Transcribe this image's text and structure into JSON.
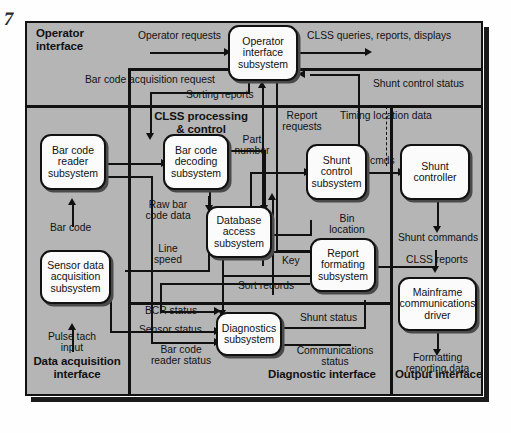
{
  "figure": {
    "folio_mark": "7",
    "background_color": "#b5b5b5",
    "node_fill": "#fbfbfb",
    "line_color": "#111111"
  },
  "regions": [
    {
      "id": "operator-interface",
      "label": "Operator\ninterface"
    },
    {
      "id": "clss-processing",
      "label": "CLSS processing\n& control"
    },
    {
      "id": "data-acquisition",
      "label": "Data acquisition\ninterface"
    },
    {
      "id": "diagnostic-interface",
      "label": "Diagnostic interface"
    },
    {
      "id": "output-interface",
      "label": "Output interface"
    }
  ],
  "region_labels": {
    "operator_interface_l1": "Operator",
    "operator_interface_l2": "interface",
    "clss_l1": "CLSS processing",
    "clss_l2": "& control",
    "data_acq_l1": "Data acquisition",
    "data_acq_l2": "interface",
    "diagnostic": "Diagnostic interface",
    "output": "Output interface"
  },
  "nodes": [
    {
      "id": "operator-interface-subsystem",
      "lines": [
        "Operator",
        "interface",
        "subsystem"
      ]
    },
    {
      "id": "bar-code-reader-subsystem",
      "lines": [
        "Bar code",
        "reader",
        "subsystem"
      ]
    },
    {
      "id": "bar-code-decoding-subsystem",
      "lines": [
        "Bar code",
        "decoding",
        "subsystem"
      ]
    },
    {
      "id": "shunt-control-subsystem",
      "lines": [
        "Shunt",
        "control",
        "subsystem"
      ]
    },
    {
      "id": "shunt-controller",
      "lines": [
        "Shunt",
        "controller"
      ]
    },
    {
      "id": "database-access-subsystem",
      "lines": [
        "Database",
        "access",
        "subsystem"
      ]
    },
    {
      "id": "report-formating-subsystem",
      "lines": [
        "Report",
        "formating",
        "subsystem"
      ]
    },
    {
      "id": "sensor-data-acquisition-subsystem",
      "lines": [
        "Sensor data",
        "acquisition",
        "subsystem"
      ]
    },
    {
      "id": "diagnostics-subsystem",
      "lines": [
        "Diagnostics",
        "subsystem"
      ]
    },
    {
      "id": "mainframe-communications-driver",
      "lines": [
        "Mainframe",
        "communications",
        "driver"
      ]
    }
  ],
  "node_text": {
    "operator_subsystem_l1": "Operator",
    "operator_subsystem_l2": "interface",
    "operator_subsystem_l3": "subsystem",
    "bcr_l1": "Bar code",
    "bcr_l2": "reader",
    "bcr_l3": "subsystem",
    "bcd_l1": "Bar code",
    "bcd_l2": "decoding",
    "bcd_l3": "subsystem",
    "shunt_ctrl_l1": "Shunt",
    "shunt_ctrl_l2": "control",
    "shunt_ctrl_l3": "subsystem",
    "shunt_controller_l1": "Shunt",
    "shunt_controller_l2": "controller",
    "db_l1": "Database",
    "db_l2": "access",
    "db_l3": "subsystem",
    "rpt_l1": "Report",
    "rpt_l2": "formating",
    "rpt_l3": "subsystem",
    "sda_l1": "Sensor data",
    "sda_l2": "acquisition",
    "sda_l3": "subsystem",
    "diag_l1": "Diagnostics",
    "diag_l2": "subsystem",
    "mf_l1": "Mainframe",
    "mf_l2": "communications",
    "mf_l3": "driver"
  },
  "flow_labels": {
    "operator_requests": "Operator requests",
    "clss_queries": "CLSS queries, reports, displays",
    "bar_code_acquisition_request": "Bar code acquisition request",
    "sorting_reports": "Sorting reports",
    "shunt_control_status": "Shunt control status",
    "report_requests_l1": "Report",
    "report_requests_l2": "requests",
    "timing_location_data": "Timing location data",
    "part_number_l1": "Part",
    "part_number_l2": "number",
    "cmds": "cmds",
    "bar_code": "Bar code",
    "raw_bar_code_data_l1": "Raw bar",
    "raw_bar_code_data_l2": "code data",
    "line_speed_l1": "Line",
    "line_speed_l2": "speed",
    "bin_location_l1": "Bin",
    "bin_location_l2": "location",
    "shunt_commands": "Shunt commands",
    "clss_reports": "CLSS reports",
    "key": "Key",
    "sort_records": "Sort records",
    "bcr_status": "BCR status",
    "sensor_status": "Sensor status",
    "bar_code_reader_status_l1": "Bar code",
    "bar_code_reader_status_l2": "reader status",
    "pulse_tach_input_l1": "Pulse tach",
    "pulse_tach_input_l2": "input",
    "shunt_status": "Shunt status",
    "communications_status_l1": "Communications",
    "communications_status_l2": "status",
    "formatting_reporting_data_l1": "Formatting",
    "formatting_reporting_data_l2": "reporting data"
  }
}
